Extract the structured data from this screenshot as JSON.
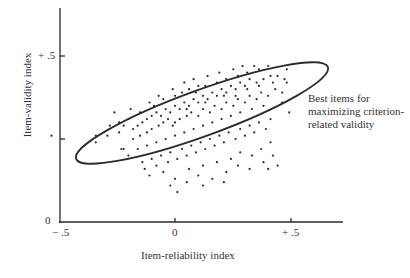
{
  "chart_data": {
    "type": "scatter",
    "title": "",
    "xlabel": "Item-reliability index",
    "ylabel": "Item-validity index",
    "xlim": [
      -0.5,
      0.72
    ],
    "ylim": [
      0,
      0.65
    ],
    "x_ticks": [
      {
        "value": -0.5,
        "label": "− .5"
      },
      {
        "value": 0,
        "label": "0"
      },
      {
        "value": 0.5,
        "label": "+ .5"
      }
    ],
    "y_ticks": [
      {
        "value": 0,
        "label": "0"
      },
      {
        "value": 0.25,
        "label": ""
      },
      {
        "value": 0.5,
        "label": "+ .5"
      }
    ],
    "grid": false,
    "annotation": {
      "lines": [
        "Best items for",
        "maximizing criterion-",
        "related validity"
      ],
      "target": "ellipse enclosing items with high reliability and high validity"
    },
    "ellipse": {
      "cx": 0.11,
      "cy": 0.325,
      "rx_px": 134,
      "ry_px": 23,
      "angle_deg": -20
    },
    "points": [
      [
        -0.53,
        0.26
      ],
      [
        -0.34,
        0.26
      ],
      [
        -0.34,
        0.24
      ],
      [
        -0.29,
        0.26
      ],
      [
        -0.23,
        0.22
      ],
      [
        -0.22,
        0.22
      ],
      [
        -0.28,
        0.29
      ],
      [
        -0.24,
        0.3
      ],
      [
        -0.2,
        0.31
      ],
      [
        -0.22,
        0.29
      ],
      [
        -0.18,
        0.28
      ],
      [
        -0.16,
        0.29
      ],
      [
        -0.14,
        0.3
      ],
      [
        -0.12,
        0.31
      ],
      [
        -0.1,
        0.32
      ],
      [
        -0.08,
        0.33
      ],
      [
        -0.06,
        0.32
      ],
      [
        -0.04,
        0.34
      ],
      [
        -0.02,
        0.33
      ],
      [
        0.0,
        0.35
      ],
      [
        0.02,
        0.34
      ],
      [
        0.04,
        0.36
      ],
      [
        0.06,
        0.35
      ],
      [
        0.08,
        0.37
      ],
      [
        0.1,
        0.36
      ],
      [
        0.12,
        0.38
      ],
      [
        0.14,
        0.37
      ],
      [
        0.16,
        0.39
      ],
      [
        0.18,
        0.38
      ],
      [
        0.2,
        0.4
      ],
      [
        0.22,
        0.39
      ],
      [
        0.24,
        0.41
      ],
      [
        0.26,
        0.4
      ],
      [
        0.28,
        0.42
      ],
      [
        0.3,
        0.41
      ],
      [
        0.32,
        0.43
      ],
      [
        0.35,
        0.42
      ],
      [
        0.38,
        0.43
      ],
      [
        0.41,
        0.44
      ],
      [
        0.44,
        0.44
      ],
      [
        0.47,
        0.43
      ],
      [
        0.48,
        0.46
      ],
      [
        -0.18,
        0.25
      ],
      [
        -0.15,
        0.26
      ],
      [
        -0.12,
        0.27
      ],
      [
        -0.1,
        0.28
      ],
      [
        -0.07,
        0.29
      ],
      [
        -0.05,
        0.3
      ],
      [
        -0.03,
        0.31
      ],
      [
        0.0,
        0.3
      ],
      [
        0.02,
        0.31
      ],
      [
        0.05,
        0.32
      ],
      [
        0.07,
        0.33
      ],
      [
        0.1,
        0.32
      ],
      [
        0.12,
        0.34
      ],
      [
        0.15,
        0.33
      ],
      [
        0.17,
        0.35
      ],
      [
        0.2,
        0.34
      ],
      [
        0.22,
        0.36
      ],
      [
        0.25,
        0.35
      ],
      [
        0.27,
        0.37
      ],
      [
        0.3,
        0.36
      ],
      [
        0.32,
        0.38
      ],
      [
        0.35,
        0.37
      ],
      [
        0.37,
        0.39
      ],
      [
        0.4,
        0.38
      ],
      [
        0.43,
        0.4
      ],
      [
        0.46,
        0.39
      ],
      [
        -0.09,
        0.35
      ],
      [
        -0.05,
        0.37
      ],
      [
        0.0,
        0.38
      ],
      [
        0.03,
        0.39
      ],
      [
        0.06,
        0.4
      ],
      [
        0.1,
        0.41
      ],
      [
        0.13,
        0.41
      ],
      [
        0.18,
        0.42
      ],
      [
        0.22,
        0.43
      ],
      [
        0.27,
        0.44
      ],
      [
        0.31,
        0.45
      ],
      [
        0.36,
        0.46
      ],
      [
        0.4,
        0.47
      ],
      [
        -0.2,
        0.2
      ],
      [
        -0.16,
        0.22
      ],
      [
        -0.12,
        0.23
      ],
      [
        -0.08,
        0.24
      ],
      [
        -0.04,
        0.25
      ],
      [
        0.0,
        0.26
      ],
      [
        0.04,
        0.27
      ],
      [
        0.08,
        0.28
      ],
      [
        0.12,
        0.29
      ],
      [
        0.16,
        0.3
      ],
      [
        0.2,
        0.31
      ],
      [
        0.24,
        0.32
      ],
      [
        0.28,
        0.33
      ],
      [
        0.33,
        0.34
      ],
      [
        0.38,
        0.35
      ],
      [
        -0.14,
        0.18
      ],
      [
        -0.1,
        0.19
      ],
      [
        -0.06,
        0.2
      ],
      [
        -0.02,
        0.21
      ],
      [
        0.03,
        0.22
      ],
      [
        0.07,
        0.23
      ],
      [
        0.11,
        0.24
      ],
      [
        0.15,
        0.25
      ],
      [
        0.19,
        0.26
      ],
      [
        0.23,
        0.27
      ],
      [
        0.28,
        0.28
      ],
      [
        0.32,
        0.29
      ],
      [
        0.36,
        0.3
      ],
      [
        0.41,
        0.31
      ],
      [
        -0.13,
        0.16
      ],
      [
        -0.08,
        0.17
      ],
      [
        -0.03,
        0.18
      ],
      [
        0.01,
        0.19
      ],
      [
        0.05,
        0.2
      ],
      [
        0.09,
        0.21
      ],
      [
        0.13,
        0.22
      ],
      [
        0.17,
        0.23
      ],
      [
        0.21,
        0.24
      ],
      [
        0.26,
        0.25
      ],
      [
        0.3,
        0.26
      ],
      [
        0.34,
        0.27
      ],
      [
        0.39,
        0.28
      ],
      [
        -0.11,
        0.14
      ],
      [
        -0.05,
        0.15
      ],
      [
        0.0,
        0.13
      ],
      [
        0.06,
        0.16
      ],
      [
        0.12,
        0.17
      ],
      [
        0.18,
        0.18
      ],
      [
        0.24,
        0.19
      ],
      [
        0.28,
        0.21
      ],
      [
        0.33,
        0.2
      ],
      [
        0.37,
        0.22
      ],
      [
        0.41,
        0.24
      ],
      [
        -0.02,
        0.11
      ],
      [
        0.05,
        0.12
      ],
      [
        0.1,
        0.14
      ],
      [
        0.16,
        0.13
      ],
      [
        0.22,
        0.15
      ],
      [
        0.27,
        0.17
      ],
      [
        0.32,
        0.16
      ],
      [
        0.38,
        0.18
      ],
      [
        0.42,
        0.2
      ],
      [
        0.4,
        0.16
      ],
      [
        0.01,
        0.09
      ],
      [
        0.12,
        0.11
      ],
      [
        0.21,
        0.12
      ],
      [
        0.44,
        0.17
      ],
      [
        0.46,
        0.36
      ],
      [
        0.49,
        0.33
      ],
      [
        0.48,
        0.42
      ],
      [
        -0.26,
        0.33
      ],
      [
        -0.24,
        0.27
      ],
      [
        -0.19,
        0.34
      ],
      [
        -0.15,
        0.33
      ],
      [
        -0.11,
        0.36
      ],
      [
        -0.07,
        0.38
      ],
      [
        -0.01,
        0.4
      ],
      [
        0.04,
        0.42
      ],
      [
        0.08,
        0.43
      ],
      [
        0.14,
        0.44
      ],
      [
        0.19,
        0.45
      ],
      [
        0.25,
        0.46
      ],
      [
        0.29,
        0.47
      ],
      [
        0.34,
        0.47
      ],
      [
        0.09,
        0.39
      ],
      [
        0.05,
        0.34
      ],
      [
        -0.01,
        0.29
      ],
      [
        0.13,
        0.36
      ],
      [
        0.21,
        0.38
      ],
      [
        0.26,
        0.38
      ],
      [
        0.31,
        0.4
      ],
      [
        0.36,
        0.41
      ],
      [
        0.42,
        0.42
      ]
    ]
  },
  "ellipse_label": "Best items ellipse"
}
